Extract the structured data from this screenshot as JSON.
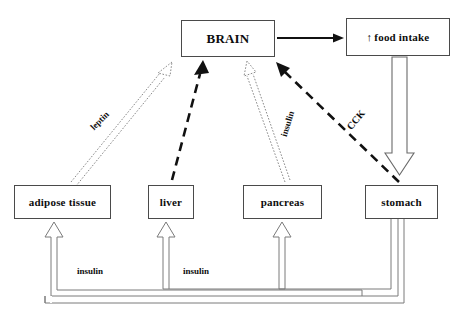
{
  "diagram": {
    "background_color": "#ffffff",
    "stroke_color": "#333333",
    "box_border_color": "#4a4a4a",
    "text_color": "#0d0d0d",
    "nodes": [
      {
        "id": "brain",
        "label": "BRAIN",
        "x": 181,
        "y": 20,
        "w": 94,
        "h": 37,
        "font_size": 13
      },
      {
        "id": "food_intake",
        "label": "food intake",
        "prefix_icon": "up-arrow-icon",
        "prefix_glyph": "↑",
        "x": 346,
        "y": 18,
        "w": 104,
        "h": 38,
        "font_size": 11
      },
      {
        "id": "adipose",
        "label": "adipose tissue",
        "x": 14,
        "y": 185,
        "w": 97,
        "h": 34,
        "font_size": 11
      },
      {
        "id": "liver",
        "label": "liver",
        "x": 148,
        "y": 185,
        "w": 46,
        "h": 34,
        "font_size": 11
      },
      {
        "id": "pancreas",
        "label": "pancreas",
        "x": 243,
        "y": 185,
        "w": 79,
        "h": 34,
        "font_size": 11
      },
      {
        "id": "stomach",
        "label": "stomach",
        "x": 365,
        "y": 185,
        "w": 73,
        "h": 34,
        "font_size": 11
      }
    ],
    "edge_labels": [
      {
        "id": "leptin-label",
        "text": "leptin",
        "x": 100,
        "y": 121,
        "rotate": -45,
        "font_size": 9
      },
      {
        "id": "insulin-brain-label",
        "text": "insulin",
        "x": 288,
        "y": 124,
        "rotate": -73,
        "font_size": 9
      },
      {
        "id": "cck-label",
        "text": "CCK",
        "x": 356,
        "y": 120,
        "rotate": -50,
        "font_size": 10
      },
      {
        "id": "insulin-adipose-label",
        "text": "insulin",
        "x": 90,
        "y": 271,
        "rotate": 0,
        "font_size": 9
      },
      {
        "id": "insulin-liver-label",
        "text": "insulin",
        "x": 196,
        "y": 271,
        "rotate": 0,
        "font_size": 9
      }
    ],
    "edges": [
      {
        "id": "brain-to-food-intake",
        "from": "brain",
        "to": "food_intake",
        "style": "solid-thin",
        "arrowhead": "solid"
      },
      {
        "id": "food-intake-to-stomach",
        "from": "food_intake",
        "to": "stomach",
        "style": "block-hollow",
        "arrowhead": "hollow-block"
      },
      {
        "id": "adipose-to-brain",
        "from": "adipose",
        "to": "brain",
        "style": "dotted-outline",
        "arrowhead": "hollow",
        "label": "leptin"
      },
      {
        "id": "liver-to-brain",
        "from": "liver",
        "to": "brain",
        "style": "dashed-thick",
        "arrowhead": "solid"
      },
      {
        "id": "pancreas-to-brain",
        "from": "pancreas",
        "to": "brain",
        "style": "dotted-outline",
        "arrowhead": "hollow",
        "label": "insulin"
      },
      {
        "id": "stomach-to-brain",
        "from": "stomach",
        "to": "brain",
        "style": "dashed-thick",
        "arrowhead": "solid",
        "label": "CCK"
      },
      {
        "id": "pancreas-to-adipose",
        "from": "pancreas",
        "to": "adipose",
        "style": "block-hollow",
        "arrowhead": "hollow-block",
        "label": "insulin"
      },
      {
        "id": "pancreas-to-liver",
        "from": "pancreas",
        "to": "liver",
        "style": "block-hollow",
        "arrowhead": "hollow-block",
        "label": "insulin"
      },
      {
        "id": "stomach-to-pancreas",
        "from": "stomach",
        "to": "pancreas",
        "style": "block-hollow",
        "arrowhead": "hollow-block"
      }
    ]
  }
}
